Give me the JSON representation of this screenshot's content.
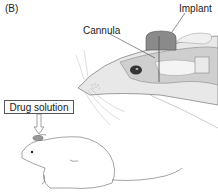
{
  "figure": {
    "panel_label": "(B)",
    "labels": {
      "implant": "Implant",
      "cannula": "Cannula",
      "drug_solution": "Drug solution"
    },
    "colors": {
      "line": "#555555",
      "implant_fill": "#8a8a8a",
      "brain_fill": "#c8c8c8",
      "skin_fill": "#e6e6e6",
      "eye": "#222222"
    }
  }
}
